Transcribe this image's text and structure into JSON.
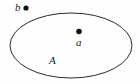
{
  "figure": {
    "type": "set-membership-venn",
    "caption": "",
    "background_color": "#fefefe",
    "stroke_color": "#2a2a2a",
    "label_color": "#1a1a1a"
  },
  "set_region": {
    "name": "A",
    "label": "A",
    "shape": "ellipse",
    "center_x": 71,
    "center_y": 45.5,
    "radius_x": 61,
    "radius_y": 32.5,
    "stroke_width": 1,
    "fill": "none"
  },
  "points": [
    {
      "id": "point-b",
      "label": "b",
      "x": 26,
      "y": 8,
      "radius": 2.6,
      "inside_set": false,
      "label_position": "left"
    },
    {
      "id": "point-a",
      "label": "a",
      "x": 79,
      "y": 31.5,
      "radius": 2.8,
      "inside_set": true,
      "label_position": "below"
    }
  ],
  "labels": {
    "point_b": "b",
    "point_a": "a",
    "set_a": "A"
  }
}
